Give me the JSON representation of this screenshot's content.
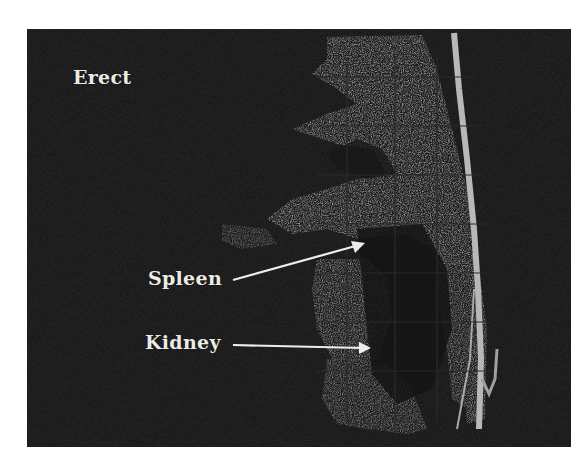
{
  "figure": {
    "type": "ultrasound-scan",
    "view_label": "Erect",
    "annotations": [
      {
        "text": "Spleen",
        "arrow_target": "spleen"
      },
      {
        "text": "Kidney",
        "arrow_target": "kidney"
      }
    ],
    "colors": {
      "background": "#111111",
      "tissue_bright": "#9c9c9c",
      "tissue_mid": "#6e6e6e",
      "label": "#ecece6",
      "page": "#ffffff"
    }
  }
}
